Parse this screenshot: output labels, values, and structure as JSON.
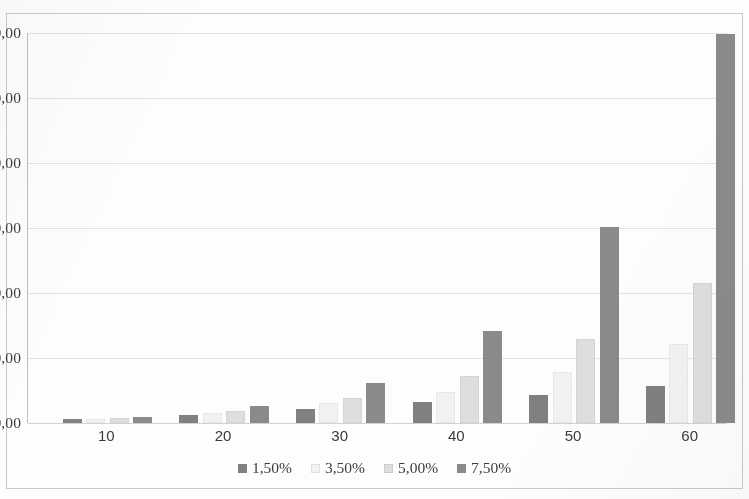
{
  "chart_data": {
    "type": "bar",
    "title": "",
    "xlabel": "",
    "ylabel": "",
    "categories": [
      "10",
      "20",
      "30",
      "40",
      "50",
      "60"
    ],
    "ylim": [
      0,
      600000
    ],
    "yticks": [
      0,
      100000,
      200000,
      300000,
      400000,
      500000,
      600000
    ],
    "ytick_labels": [
      "0,00",
      "100.000,00",
      "200.000,00",
      "300.000,00",
      "400.000,00",
      "500.000,00",
      "600.000,00"
    ],
    "grid": true,
    "legend_position": "bottom",
    "number_format": "european",
    "series": [
      {
        "name": "1,50%",
        "color": "#808080",
        "values": [
          5500,
          13000,
          21000,
          32000,
          43000,
          57000
        ]
      },
      {
        "name": "3,50%",
        "color": "#f2f2f2",
        "values": [
          6000,
          16000,
          31000,
          48000,
          79000,
          122000
        ]
      },
      {
        "name": "5,00%",
        "color": "#dedede",
        "values": [
          8000,
          19000,
          39000,
          72000,
          129000,
          216000
        ]
      },
      {
        "name": "7,50%",
        "color": "#8a8a8a",
        "values": [
          9500,
          26000,
          62000,
          141000,
          301000,
          598000
        ]
      }
    ]
  },
  "legend": {
    "items": [
      {
        "label": "1,50%",
        "color": "#808080"
      },
      {
        "label": "3,50%",
        "color": "#f2f2f2"
      },
      {
        "label": "5,00%",
        "color": "#dedede"
      },
      {
        "label": "7,50%",
        "color": "#8a8a8a"
      }
    ]
  }
}
